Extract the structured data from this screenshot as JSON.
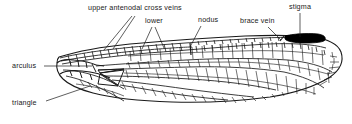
{
  "figure": {
    "background_color": "#ffffff",
    "ink_color": "#1a1a1a",
    "stigma_color": "#000000"
  },
  "labels": [
    {
      "id": "upper-antenodal-cross-veins",
      "text": "upper antenodal cross veins",
      "x": 88,
      "y": 6
    },
    {
      "id": "lower",
      "text": "lower",
      "x": 145,
      "y": 19
    },
    {
      "id": "nodus",
      "text": "nodus",
      "x": 198,
      "y": 18
    },
    {
      "id": "brace-vein",
      "text": "brace vein",
      "x": 240,
      "y": 19
    },
    {
      "id": "stigma",
      "text": "stigma",
      "x": 290,
      "y": 5
    },
    {
      "id": "arculus",
      "text": "arculus",
      "x": 12,
      "y": 63
    },
    {
      "id": "triangle",
      "text": "triangle",
      "x": 12,
      "y": 100
    }
  ],
  "leader_lines": [
    {
      "id": "leader-upper-antenodal-a",
      "from": [
        132,
        16
      ],
      "to": [
        104,
        50
      ]
    },
    {
      "id": "leader-upper-antenodal-b",
      "from": [
        134,
        16
      ],
      "to": [
        112,
        49
      ]
    },
    {
      "id": "leader-lower-a",
      "from": [
        152,
        28
      ],
      "to": [
        142,
        49
      ]
    },
    {
      "id": "leader-lower-b",
      "from": [
        154,
        28
      ],
      "to": [
        163,
        48
      ]
    },
    {
      "id": "leader-nodus",
      "from": [
        201,
        27
      ],
      "to": [
        190,
        48
      ]
    },
    {
      "id": "leader-brace-vein",
      "from": [
        268,
        28
      ],
      "to": [
        280,
        41
      ]
    },
    {
      "id": "leader-stigma",
      "from": [
        300,
        14
      ],
      "to": [
        300,
        40
      ]
    },
    {
      "id": "leader-arculus",
      "from": [
        44,
        66
      ],
      "to": [
        92,
        66
      ]
    },
    {
      "id": "leader-triangle",
      "from": [
        46,
        101
      ],
      "to": [
        88,
        86
      ]
    }
  ]
}
